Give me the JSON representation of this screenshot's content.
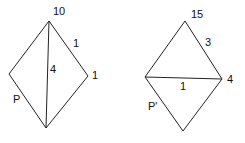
{
  "left_figure": {
    "name": "P",
    "vertices": {
      "top": [
        49,
        21
      ],
      "left": [
        9,
        74
      ],
      "right": [
        88,
        76
      ],
      "bottom": [
        46,
        128
      ]
    },
    "labels": {
      "top": "10",
      "top_right_edge": "1",
      "right": "1",
      "diagonal": "4",
      "polygon": "P"
    }
  },
  "right_figure": {
    "name": "P'",
    "vertices": {
      "top": [
        185,
        21
      ],
      "left": [
        145,
        77
      ],
      "right": [
        222,
        79
      ],
      "bottom": [
        183,
        131
      ]
    },
    "labels": {
      "top": "15",
      "top_right_edge": "3",
      "right": "4",
      "diagonal": "1",
      "polygon": "P'"
    }
  },
  "stroke_color": "#222222"
}
